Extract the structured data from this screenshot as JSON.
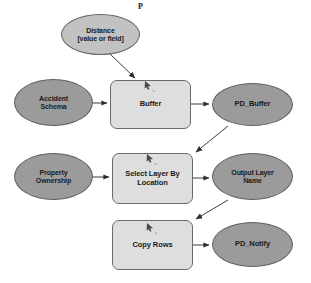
{
  "diagram": {
    "annotations": [
      {
        "id": "parameter-flag-distance",
        "name": "parameter-flag",
        "text": "P",
        "x": 138,
        "y": 2,
        "size": 8
      }
    ],
    "colors": {
      "canvas": "#ffffff",
      "data_variable_fill": "#9b9b9b",
      "parameter_variable_fill": "#c2c2c2",
      "process_fill": "#dedede",
      "node_stroke": "#5f5f5f",
      "process_stroke": "#6a6a6a",
      "connector": "#3d3d3d",
      "label_text": "#1a1a1a"
    },
    "nodes": [
      {
        "id": "distance",
        "name": "variable-distance",
        "kind": "parameter-variable",
        "shape": "ellipse",
        "label": "Distance\n[value or field]",
        "x": 61,
        "y": 14,
        "w": 79,
        "h": 41,
        "font_size": 7
      },
      {
        "id": "accident-schema",
        "name": "variable-accident-schema",
        "kind": "data-variable",
        "shape": "ellipse",
        "label": "Accident\nSchema",
        "x": 14,
        "y": 79,
        "w": 79,
        "h": 47,
        "font_size": 7
      },
      {
        "id": "buffer",
        "name": "process-buffer",
        "kind": "process",
        "shape": "rounded-rect",
        "label": "Buffer",
        "x": 110,
        "y": 80,
        "w": 81,
        "h": 49,
        "font_size": 7.5
      },
      {
        "id": "pd-buffer",
        "name": "variable-pd-buffer",
        "kind": "data-variable",
        "shape": "ellipse",
        "label": "PD_Buffer",
        "x": 212,
        "y": 83,
        "w": 81,
        "h": 43,
        "font_size": 7.5
      },
      {
        "id": "property-ownership",
        "name": "variable-property-ownership",
        "kind": "data-variable",
        "shape": "ellipse",
        "label": "Property\nOwnership",
        "x": 14,
        "y": 153,
        "w": 79,
        "h": 47,
        "font_size": 7
      },
      {
        "id": "select-layer-by-location",
        "name": "process-select-layer-by-location",
        "kind": "process",
        "shape": "rounded-rect",
        "label": "Select Layer By\nLocation",
        "x": 112,
        "y": 153,
        "w": 81,
        "h": 51,
        "font_size": 7.5
      },
      {
        "id": "output-layer-name",
        "name": "variable-output-layer-name",
        "kind": "data-variable",
        "shape": "ellipse",
        "label": "Output Layer\nName",
        "x": 212,
        "y": 153,
        "w": 81,
        "h": 47,
        "font_size": 7
      },
      {
        "id": "copy-rows",
        "name": "process-copy-rows",
        "kind": "process",
        "shape": "rounded-rect",
        "label": "Copy Rows",
        "x": 112,
        "y": 220,
        "w": 81,
        "h": 50,
        "font_size": 7.5
      },
      {
        "id": "pd-notify",
        "name": "variable-pd-notify",
        "kind": "data-variable",
        "shape": "ellipse",
        "label": "PD_Notify",
        "x": 212,
        "y": 222,
        "w": 81,
        "h": 45,
        "font_size": 7.5
      }
    ],
    "edges": [
      {
        "id": "edge-distance-buffer",
        "name": "connector-distance-to-buffer",
        "from": "distance",
        "to": "buffer",
        "path": "M 110 54 L 135 78",
        "arrow": "down-right"
      },
      {
        "id": "edge-accident-buffer",
        "name": "connector-accident-schema-to-buffer",
        "from": "accident-schema",
        "to": "buffer",
        "path": "M 93 103 L 107 103",
        "arrow": "right"
      },
      {
        "id": "edge-buffer-pdbuffer",
        "name": "connector-buffer-to-pd-buffer",
        "from": "buffer",
        "to": "pd-buffer",
        "path": "M 191 104 L 209 104",
        "arrow": "right"
      },
      {
        "id": "edge-pdbuffer-select",
        "name": "connector-pd-buffer-to-select-layer",
        "from": "pd-buffer",
        "to": "select-layer-by-location",
        "path": "M 228 126 L 196 152",
        "arrow": "down-left"
      },
      {
        "id": "edge-property-select",
        "name": "connector-property-ownership-to-select-layer",
        "from": "property-ownership",
        "to": "select-layer-by-location",
        "path": "M 93 177 L 109 177",
        "arrow": "right"
      },
      {
        "id": "edge-select-output",
        "name": "connector-select-layer-to-output-layer-name",
        "from": "select-layer-by-location",
        "to": "output-layer-name",
        "path": "M 193 178 L 209 178",
        "arrow": "right"
      },
      {
        "id": "edge-output-copyrows",
        "name": "connector-output-layer-name-to-copy-rows",
        "from": "output-layer-name",
        "to": "copy-rows",
        "path": "M 228 200 L 196 219",
        "arrow": "down-left"
      },
      {
        "id": "edge-copyrows-pdnotify",
        "name": "connector-copy-rows-to-pd-notify",
        "from": "copy-rows",
        "to": "pd-notify",
        "path": "M 193 245 L 209 245",
        "arrow": "right"
      }
    ],
    "cursor_glyphs": [
      {
        "id": "cursor-buffer",
        "name": "cursor-arrow-icon",
        "x": 143,
        "y": 80
      },
      {
        "id": "cursor-select",
        "name": "cursor-arrow-icon",
        "x": 145,
        "y": 153
      },
      {
        "id": "cursor-copy",
        "name": "cursor-arrow-icon",
        "x": 145,
        "y": 222
      }
    ]
  }
}
